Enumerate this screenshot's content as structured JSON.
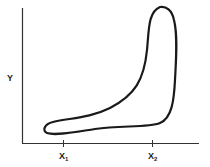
{
  "diagram": {
    "type": "closed-contour",
    "axes": {
      "y_label": "Y",
      "x_ticks": [
        {
          "base": "X",
          "subscript": "1"
        },
        {
          "base": "X",
          "subscript": "2"
        }
      ]
    },
    "colors": {
      "stroke": "#1a1a1a",
      "axis": "#333333",
      "background": "#ffffff"
    }
  }
}
